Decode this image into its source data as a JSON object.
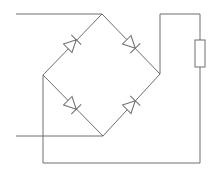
{
  "diagram": {
    "type": "circuit-schematic",
    "title": "",
    "colors": {
      "background": "#ffffff",
      "line": "#6e6e6e"
    },
    "nodes": {
      "top": [
        102,
        14
      ],
      "left": [
        43,
        75
      ],
      "right": [
        160,
        74
      ],
      "bottom": [
        103,
        136
      ]
    },
    "inputs": [
      {
        "name": "ac-input-top",
        "from": [
          16,
          14
        ],
        "to": [
          102,
          14
        ]
      },
      {
        "name": "ac-input-bottom",
        "from": [
          16,
          136
        ],
        "to": [
          103,
          136
        ]
      }
    ],
    "diodes": [
      {
        "name": "diode-top-left",
        "from": "left",
        "to": "top",
        "center": [
          72,
          44
        ],
        "angle": -45
      },
      {
        "name": "diode-top-right",
        "from": "top",
        "to": "right",
        "center": [
          131,
          44
        ],
        "angle": 45
      },
      {
        "name": "diode-bottom-left",
        "from": "left",
        "to": "bottom",
        "center": [
          72,
          105
        ],
        "angle": 45
      },
      {
        "name": "diode-bottom-right",
        "from": "bottom",
        "to": "right",
        "center": [
          131,
          105
        ],
        "angle": -45
      }
    ],
    "load": {
      "name": "resistor",
      "x": 195,
      "y": 40,
      "width": 10,
      "height": 27
    },
    "output_path": {
      "positive": [
        [
          160,
          74
        ],
        [
          160,
          14
        ],
        [
          200,
          14
        ],
        [
          200,
          40
        ]
      ],
      "negative": [
        [
          200,
          67
        ],
        [
          200,
          163
        ],
        [
          43,
          163
        ],
        [
          43,
          75
        ]
      ]
    }
  }
}
